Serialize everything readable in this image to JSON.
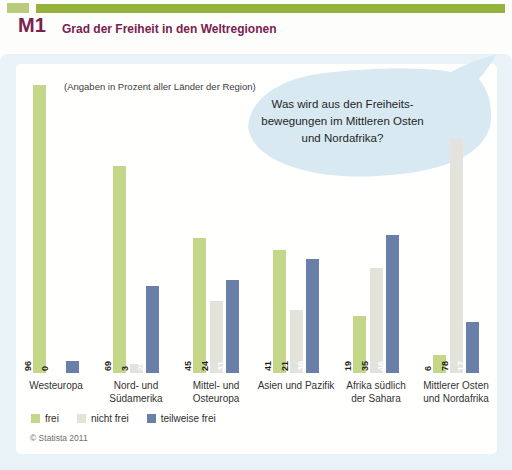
{
  "header": {
    "code": "M1",
    "title": "Grad der Freiheit in den Weltregionen"
  },
  "note": "(Angaben in Prozent aller Länder der Region)",
  "bubble": {
    "lines": [
      "Was wird aus den Freiheits-",
      "bewegungen im Mittleren Osten",
      "und Nordafrika?"
    ]
  },
  "chart_data": {
    "type": "bar",
    "title": "Grad der Freiheit in den Weltregionen",
    "subtitle": "(Angaben in Prozent aller Länder der Region)",
    "unit": "percent",
    "xlabel": "",
    "ylabel": "",
    "ylim": [
      0,
      100
    ],
    "grid": false,
    "legend_position": "bottom",
    "categories": [
      "Westeuropa",
      "Nord- und Südamerika",
      "Mittel- und Osteuropa",
      "Asien und Pazifik",
      "Afrika südlich der Sahara",
      "Mittlerer Osten und Nordafrika"
    ],
    "category_lines": [
      [
        "Westeuropa"
      ],
      [
        "Nord- und",
        "Südamerika"
      ],
      [
        "Mittel- und",
        "Osteuropa"
      ],
      [
        "Asien und Pazifik"
      ],
      [
        "Afrika südlich",
        "der Sahara"
      ],
      [
        "Mittlerer Osten",
        "und Nordafrika"
      ]
    ],
    "series": [
      {
        "name": "frei",
        "color": "#c4d788",
        "value_label_color": "#1f1f1f",
        "values": [
          96,
          69,
          45,
          41,
          19,
          6
        ]
      },
      {
        "name": "nicht frei",
        "color": "#e3e3dc",
        "value_label_color": "#1f1f1f",
        "values": [
          0,
          3,
          24,
          21,
          35,
          78
        ]
      },
      {
        "name": "teilweise frei",
        "color": "#6b80a9",
        "value_label_color": "#ffffff",
        "values": [
          4,
          29,
          31,
          38,
          46,
          17
        ]
      }
    ]
  },
  "footer": {
    "copyright": "© Statista 2011"
  },
  "colors": {
    "accent_olive_green": "#95b23d",
    "accent_light_green": "#b9cc7e",
    "heading_maroon": "#7a2150",
    "content_background": "#e9f2f6",
    "bubble_blue": "#d8e9f2"
  }
}
